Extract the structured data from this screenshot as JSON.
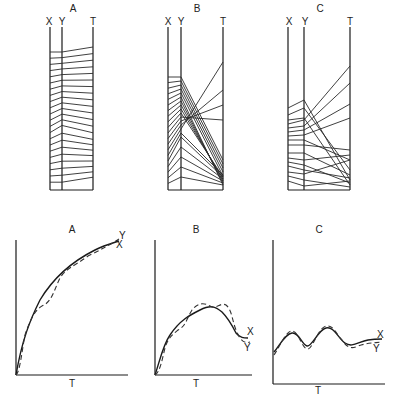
{
  "parallel_panels": [
    {
      "title": "A",
      "axes": [
        "X",
        "Y",
        "T"
      ]
    },
    {
      "title": "B",
      "axes": [
        "X",
        "Y",
        "T"
      ]
    },
    {
      "title": "C",
      "axes": [
        "X",
        "Y",
        "T"
      ]
    }
  ],
  "curve_panels": [
    {
      "title": "A",
      "xlabel": "T",
      "series": [
        "X",
        "Y"
      ],
      "shape": "monotone increasing, saturating"
    },
    {
      "title": "B",
      "xlabel": "T",
      "series": [
        "X",
        "Y"
      ],
      "shape": "rise then fall (single hump)"
    },
    {
      "title": "C",
      "xlabel": "T",
      "series": [
        "X",
        "Y"
      ],
      "shape": "oscillating, low amplitude"
    }
  ],
  "legend_note": "Solid line = X, dashed line = Y"
}
